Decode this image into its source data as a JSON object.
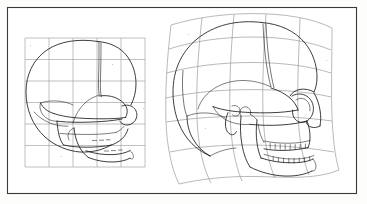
{
  "figure": {
    "style": "scanned line drawing, black ink on white",
    "border": {
      "present": true,
      "color": "#3a3a3a",
      "x": 7,
      "y": 7,
      "width": 350,
      "height": 187
    },
    "background_color": "#fdfdfc",
    "ink_color": "#1b1b1b",
    "grid_color": "#9a9a96"
  },
  "panels": [
    {
      "id": "left-panel",
      "name": "infant-skull-reference-grid",
      "label": "Infant skull on undeformed Cartesian grid",
      "specimen": "infant / juvenile human skull, lateral view, facing right",
      "grid": {
        "type": "rectilinear",
        "columns": 5,
        "rows": 6,
        "x": 25,
        "y": 38,
        "width": 120,
        "height": 129,
        "deformed": false
      },
      "features": [
        "large rounded neurocranium",
        "coronal suture",
        "small facial skeleton",
        "orbit",
        "maxilla",
        "mandible",
        "zygomatic arch",
        "tympanic ring"
      ]
    },
    {
      "id": "right-panel",
      "name": "adult-skull-deformed-grid",
      "label": "Adult skull on deformed curvilinear grid",
      "specimen": "adult human skull, lateral view, facing right",
      "grid": {
        "type": "curvilinear-deformed",
        "columns": 5,
        "rows": 6,
        "x": 165,
        "y": 14,
        "width": 175,
        "height": 172,
        "deformed": true
      },
      "features": [
        "cranial vault",
        "coronal suture",
        "frontal bone",
        "orbit",
        "nasal aperture",
        "zygomatic arch",
        "maxilla with dental arcade",
        "mandible with dental arcade",
        "mastoid process",
        "occipital region"
      ],
      "teeth": {
        "upper_row_count": 8,
        "lower_row_count": 8
      }
    }
  ],
  "chart_data": {
    "type": "diagram",
    "panel_labels": [
      "Infant skull on rectangular grid",
      "Adult skull on deformed grid"
    ],
    "grid_columns": 5,
    "grid_rows": 6
  }
}
